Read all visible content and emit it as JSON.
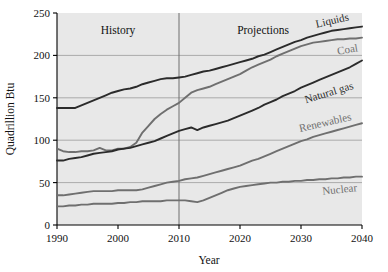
{
  "chart_data": {
    "type": "line",
    "title": "",
    "xlabel": "Year",
    "ylabel": "Quadrillion Btu",
    "xlim": [
      1990,
      2040
    ],
    "ylim": [
      0,
      250
    ],
    "xticks": [
      1990,
      2000,
      2010,
      2020,
      2030,
      2040
    ],
    "yticks": [
      0,
      50,
      100,
      150,
      200,
      250
    ],
    "grid": "horizontal",
    "legend_position": "inline-right",
    "annotations": [
      {
        "text": "History",
        "x": 1999,
        "y": 238
      },
      {
        "text": "Projections",
        "x": 2021,
        "y": 238
      }
    ],
    "divider_x": 2010,
    "x": [
      1990,
      1991,
      1992,
      1993,
      1994,
      1995,
      1996,
      1997,
      1998,
      1999,
      2000,
      2001,
      2002,
      2003,
      2004,
      2005,
      2006,
      2007,
      2008,
      2009,
      2010,
      2011,
      2012,
      2013,
      2014,
      2015,
      2016,
      2017,
      2018,
      2019,
      2020,
      2021,
      2022,
      2023,
      2024,
      2025,
      2026,
      2027,
      2028,
      2029,
      2030,
      2031,
      2032,
      2033,
      2034,
      2035,
      2036,
      2037,
      2038,
      2039,
      2040
    ],
    "series": [
      {
        "name": "Liquids",
        "color": "#2b2b2b",
        "values": [
          138,
          138,
          138,
          138,
          141,
          144,
          147,
          150,
          153,
          156,
          158,
          160,
          161,
          163,
          166,
          168,
          170,
          172,
          173,
          173,
          174,
          175,
          177,
          179,
          181,
          182,
          184,
          186,
          188,
          190,
          192,
          194,
          196,
          199,
          201,
          204,
          207,
          210,
          213,
          216,
          218,
          221,
          223,
          225,
          227,
          229,
          230,
          231,
          232,
          233,
          234
        ]
      },
      {
        "name": "Coal",
        "color": "#6f6f6f",
        "values": [
          90,
          87,
          86,
          86,
          87,
          87,
          88,
          91,
          88,
          88,
          90,
          90,
          92,
          97,
          109,
          117,
          125,
          131,
          136,
          140,
          144,
          150,
          156,
          159,
          161,
          163,
          166,
          169,
          172,
          175,
          178,
          182,
          186,
          189,
          192,
          195,
          199,
          202,
          205,
          208,
          211,
          213,
          215,
          216,
          217,
          218,
          219,
          219,
          220,
          220,
          221
        ]
      },
      {
        "name": "Natural gas",
        "color": "#2b2b2b",
        "values": [
          76,
          76,
          78,
          79,
          80,
          82,
          84,
          85,
          86,
          87,
          89,
          90,
          91,
          93,
          95,
          97,
          99,
          102,
          105,
          108,
          111,
          113,
          115,
          112,
          115,
          117,
          119,
          121,
          123,
          126,
          129,
          132,
          135,
          138,
          142,
          145,
          148,
          152,
          155,
          158,
          162,
          165,
          168,
          171,
          174,
          177,
          180,
          183,
          186,
          190,
          194
        ]
      },
      {
        "name": "Renewables",
        "color": "#6f6f6f",
        "values": [
          35,
          35,
          36,
          37,
          38,
          39,
          40,
          40,
          40,
          40,
          41,
          41,
          41,
          41,
          42,
          44,
          46,
          48,
          50,
          51,
          52,
          54,
          55,
          56,
          58,
          60,
          62,
          64,
          66,
          68,
          70,
          73,
          76,
          78,
          81,
          84,
          87,
          90,
          93,
          96,
          99,
          101,
          104,
          106,
          108,
          110,
          112,
          114,
          116,
          118,
          120
        ]
      },
      {
        "name": "Nuclear",
        "color": "#6f6f6f",
        "values": [
          22,
          22,
          23,
          23,
          24,
          24,
          25,
          25,
          25,
          25,
          26,
          26,
          27,
          27,
          28,
          28,
          28,
          28,
          29,
          29,
          29,
          29,
          28,
          27,
          29,
          32,
          35,
          38,
          41,
          43,
          45,
          46,
          47,
          48,
          49,
          50,
          50,
          51,
          51,
          52,
          52,
          53,
          53,
          54,
          54,
          55,
          55,
          56,
          56,
          57,
          57
        ]
      }
    ]
  },
  "axis": {
    "y_title": "Quadrillion Btu",
    "x_title": "Year",
    "yticks": [
      "0",
      "50",
      "100",
      "150",
      "200",
      "250"
    ],
    "xticks": [
      "1990",
      "2000",
      "2010",
      "2020",
      "2030",
      "2040"
    ]
  },
  "periods": {
    "history": "History",
    "projections": "Projections"
  },
  "series_labels": {
    "liquids": "Liquids",
    "coal": "Coal",
    "natural_gas": "Natural gas",
    "renewables": "Renewables",
    "nuclear": "Nuclear"
  },
  "colors": {
    "dark_series": "#2b2b2b",
    "gray_series": "#6f6f6f",
    "plot_background": "#e8e8e8",
    "gridline": "#9a9a9a",
    "axis": "#000000"
  }
}
